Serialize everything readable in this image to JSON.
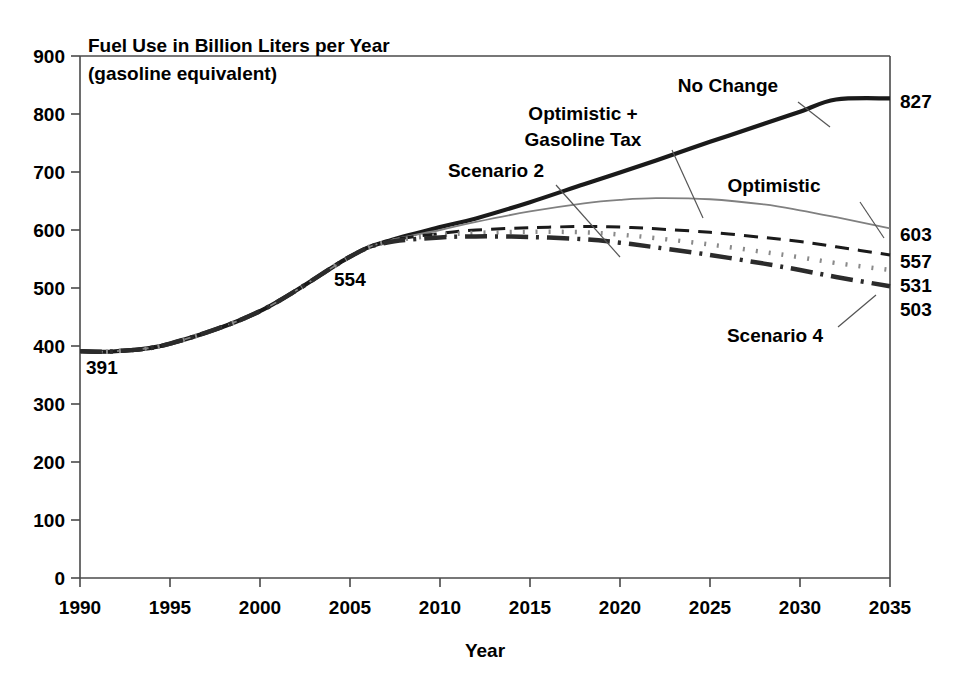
{
  "chart_data": {
    "type": "line",
    "title": "Fuel Use in Billion Liters per Year",
    "subtitle": "(gasoline equivalent)",
    "xlabel": "Year",
    "ylabel": "",
    "xlim": [
      1990,
      2035
    ],
    "ylim": [
      0,
      900
    ],
    "grid": false,
    "legend_position": "inline-annotations",
    "x_ticks": [
      "1990",
      "1995",
      "2000",
      "2005",
      "2010",
      "2015",
      "2020",
      "2025",
      "2030",
      "2035"
    ],
    "y_ticks": [
      "0",
      "100",
      "200",
      "300",
      "400",
      "500",
      "600",
      "700",
      "800",
      "900"
    ],
    "x": [
      1990,
      1992,
      1995,
      2000,
      2005,
      2007,
      2010,
      2012,
      2015,
      2018,
      2020,
      2022,
      2025,
      2028,
      2030,
      2032,
      2035
    ],
    "series": [
      {
        "name": "No Change",
        "style": "solid-thick-black",
        "color": "#1a1a1a",
        "width": 4.2,
        "dash": "none",
        "end_value": 827,
        "values": [
          391,
          391,
          404,
          460,
          554,
          580,
          605,
          620,
          648,
          679,
          699,
          720,
          752,
          783,
          804,
          825,
          827
        ]
      },
      {
        "name": "Optimistic",
        "style": "solid-thin-gray",
        "color": "#808080",
        "width": 1.8,
        "dash": "none",
        "end_value": 603,
        "values": [
          391,
          391,
          404,
          460,
          554,
          580,
          600,
          614,
          632,
          646,
          652,
          655,
          653,
          644,
          634,
          622,
          603
        ]
      },
      {
        "name": "Scenario 2",
        "style": "dashed-black",
        "color": "#1a1a1a",
        "width": 3.0,
        "dash": "14 9",
        "end_value": 557,
        "values": [
          391,
          391,
          404,
          460,
          554,
          580,
          594,
          600,
          604,
          606,
          605,
          602,
          596,
          587,
          580,
          571,
          557
        ]
      },
      {
        "name": "Optimistic + Gasoline Tax",
        "style": "dotted-gray",
        "color": "#8a8a8a",
        "width": 4.5,
        "dash": "2 11",
        "end_value": 531,
        "values": [
          391,
          391,
          404,
          460,
          554,
          579,
          591,
          595,
          597,
          596,
          592,
          586,
          575,
          562,
          553,
          543,
          531
        ]
      },
      {
        "name": "Scenario 4",
        "style": "dash-dot-thick-black",
        "color": "#2b2b2b",
        "width": 4.5,
        "dash": "22 8 3 8",
        "end_value": 503,
        "values": [
          391,
          391,
          404,
          460,
          554,
          578,
          587,
          589,
          588,
          584,
          578,
          570,
          557,
          542,
          531,
          519,
          503
        ]
      }
    ],
    "annotations": [
      {
        "text": "No Change",
        "x_px": 728,
        "y_px": 92,
        "leader": [
          [
            798,
            102
          ],
          [
            830,
            127
          ]
        ]
      },
      {
        "text": "Optimistic + Gasoline Tax",
        "line1": "Optimistic +",
        "line2": "Gasoline Tax",
        "x_px": 583,
        "y_px": 120,
        "leader": [
          [
            672,
            150
          ],
          [
            703,
            218
          ]
        ]
      },
      {
        "text": "Scenario 2",
        "x_px": 496,
        "y_px": 177,
        "leader": [
          [
            556,
            185
          ],
          [
            620,
            257
          ]
        ]
      },
      {
        "text": "Optimistic",
        "x_px": 774,
        "y_px": 192,
        "leader": [
          [
            860,
            202
          ],
          [
            884,
            238
          ]
        ]
      },
      {
        "text": "Scenario 4",
        "x_px": 775,
        "y_px": 342,
        "leader": [
          [
            838,
            327
          ],
          [
            876,
            295
          ]
        ]
      }
    ],
    "point_labels": [
      {
        "text": "391",
        "x_px": 86,
        "y_px": 374
      },
      {
        "text": "554",
        "x_px": 334,
        "y_px": 286
      }
    ],
    "end_labels": [
      {
        "text": "827",
        "y_px": 108
      },
      {
        "text": "603",
        "y_px": 241
      },
      {
        "text": "557",
        "y_px": 268
      },
      {
        "text": "531",
        "y_px": 292
      },
      {
        "text": "503",
        "y_px": 316
      }
    ]
  }
}
